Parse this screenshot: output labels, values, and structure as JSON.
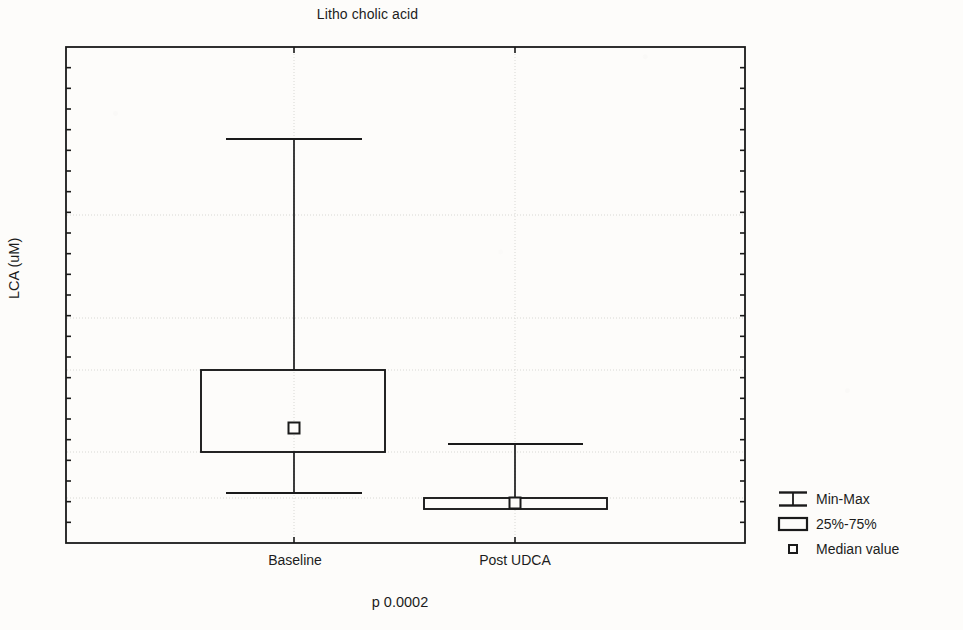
{
  "chart_data": {
    "type": "box",
    "title": "Litho cholic acid",
    "xlabel": "",
    "ylabel": "LCA (uM)",
    "categories": [
      "Baseline",
      "Post UDCA"
    ],
    "annotation": "p 0.0002",
    "grid": true,
    "axis_tick_labels": [],
    "legend": {
      "position": "right",
      "entries": [
        {
          "key": "min-max-icon",
          "label": "Min-Max"
        },
        {
          "key": "quartile-box-icon",
          "label": "25%-75%"
        },
        {
          "key": "median-marker-icon",
          "label": "Median value"
        }
      ]
    },
    "boxes": [
      {
        "category": "Baseline",
        "min_y": 493,
        "q1_y": 452,
        "median_y": 428,
        "q3_y": 370,
        "max_y": 139,
        "center_x": 294,
        "box_left_x": 201,
        "box_right_x": 385,
        "cap_left_x": 226,
        "cap_right_x": 362
      },
      {
        "category": "Post UDCA",
        "min_y": 509,
        "q1_y": 509,
        "median_y": 503,
        "q3_y": 498,
        "max_y": 444,
        "center_x": 515,
        "box_left_x": 424,
        "box_right_x": 607,
        "cap_left_x": 448,
        "cap_right_x": 583
      }
    ],
    "plot_frame": {
      "left": 66,
      "right": 745,
      "top": 47,
      "bottom": 543
    },
    "gridlines_y": [
      215,
      318,
      370,
      452,
      498
    ],
    "colors": {
      "line": "#1a1a1a",
      "grid": "#d8d8d4",
      "background": "#fdfcfa",
      "text": "#1c1c1c"
    }
  }
}
